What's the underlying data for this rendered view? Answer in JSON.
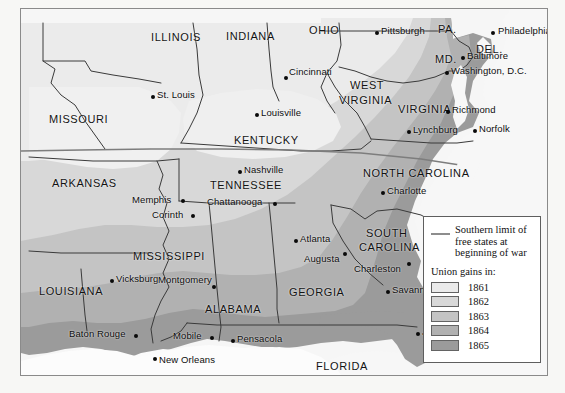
{
  "map": {
    "title": "Union gains during the Civil War",
    "states": [
      {
        "name": "MISSOURI",
        "x": 28,
        "y": 104,
        "size": "lg"
      },
      {
        "name": "ILLINOIS",
        "x": 130,
        "y": 22,
        "size": "lg"
      },
      {
        "name": "INDIANA",
        "x": 205,
        "y": 21,
        "size": "lg"
      },
      {
        "name": "OHIO",
        "x": 288,
        "y": 15,
        "size": "lg"
      },
      {
        "name": "PA.",
        "x": 417,
        "y": 14,
        "size": "lg"
      },
      {
        "name": "DEL.",
        "x": 455,
        "y": 34,
        "size": "lg"
      },
      {
        "name": "MD.",
        "x": 414,
        "y": 44,
        "size": "lg"
      },
      {
        "name": "WEST",
        "x": 329,
        "y": 70,
        "size": "lg"
      },
      {
        "name": "VIRGINIA",
        "x": 318,
        "y": 85,
        "size": "lg"
      },
      {
        "name": "VIRGINIA",
        "x": 377,
        "y": 94,
        "size": "lg"
      },
      {
        "name": "KENTUCKY",
        "x": 213,
        "y": 125,
        "size": "lg"
      },
      {
        "name": "ARKANSAS",
        "x": 31,
        "y": 168,
        "size": "lg"
      },
      {
        "name": "TENNESSEE",
        "x": 189,
        "y": 170,
        "size": "lg"
      },
      {
        "name": "NORTH CAROLINA",
        "x": 342,
        "y": 158,
        "size": "lg"
      },
      {
        "name": "SOUTH",
        "x": 345,
        "y": 218,
        "size": "lg"
      },
      {
        "name": "CAROLINA",
        "x": 338,
        "y": 232,
        "size": "lg"
      },
      {
        "name": "MISSISSIPPI",
        "x": 112,
        "y": 241,
        "size": "lg"
      },
      {
        "name": "LOUISIANA",
        "x": 18,
        "y": 276,
        "size": "lg"
      },
      {
        "name": "ALABAMA",
        "x": 184,
        "y": 294,
        "size": "lg"
      },
      {
        "name": "GEORGIA",
        "x": 268,
        "y": 277,
        "size": "lg"
      },
      {
        "name": "FLORIDA",
        "x": 295,
        "y": 351,
        "size": "lg"
      }
    ],
    "cities": [
      {
        "name": "Pittsburgh",
        "dx": 354,
        "dy": 22,
        "tx": 360,
        "ty": 16,
        "anchor": "left"
      },
      {
        "name": "Philadelphia",
        "dx": 470,
        "dy": 22,
        "tx": 477,
        "ty": 16,
        "anchor": "left"
      },
      {
        "name": "Baltimore",
        "dx": 440,
        "dy": 47,
        "tx": 446,
        "ty": 41,
        "anchor": "left"
      },
      {
        "name": "Washington, D.C.",
        "dx": 424,
        "dy": 62,
        "tx": 430,
        "ty": 56,
        "anchor": "left"
      },
      {
        "name": "Cincinnati",
        "dx": 263,
        "dy": 67,
        "tx": 268,
        "ty": 57,
        "anchor": "left"
      },
      {
        "name": "St. Louis",
        "dx": 130,
        "dy": 86,
        "tx": 136,
        "ty": 80,
        "anchor": "left"
      },
      {
        "name": "Louisville",
        "dx": 234,
        "dy": 104,
        "tx": 240,
        "ty": 98,
        "anchor": "left"
      },
      {
        "name": "Richmond",
        "dx": 425,
        "dy": 101,
        "tx": 431,
        "ty": 95,
        "anchor": "left"
      },
      {
        "name": "Lynchburg",
        "dx": 386,
        "dy": 121,
        "tx": 392,
        "ty": 115,
        "anchor": "left"
      },
      {
        "name": "Norfolk",
        "dx": 452,
        "dy": 120,
        "tx": 458,
        "ty": 114,
        "anchor": "left"
      },
      {
        "name": "Nashville",
        "dx": 217,
        "dy": 161,
        "tx": 223,
        "ty": 155,
        "anchor": "left"
      },
      {
        "name": "Charlotte",
        "dx": 360,
        "dy": 182,
        "tx": 366,
        "ty": 176,
        "anchor": "left"
      },
      {
        "name": "Memphis",
        "dx": 160,
        "dy": 190,
        "tx": 124,
        "ty": 185,
        "anchor": "right"
      },
      {
        "name": "Chattanooga",
        "dx": 252,
        "dy": 193,
        "tx": 200,
        "ty": 187,
        "anchor": "right"
      },
      {
        "name": "Corinth",
        "dx": 170,
        "dy": 205,
        "tx": 133,
        "ty": 200,
        "anchor": "right"
      },
      {
        "name": "Atlanta",
        "dx": 273,
        "dy": 230,
        "tx": 279,
        "ty": 224,
        "anchor": "left"
      },
      {
        "name": "Augusta",
        "dx": 322,
        "dy": 243,
        "tx": 283,
        "ty": 244,
        "anchor": "right"
      },
      {
        "name": "Charleston",
        "dx": 386,
        "dy": 253,
        "tx": 346,
        "ty": 254,
        "anchor": "right"
      },
      {
        "name": "Vicksburg",
        "dx": 89,
        "dy": 270,
        "tx": 95,
        "ty": 264,
        "anchor": "left"
      },
      {
        "name": "Montgomery",
        "dx": 191,
        "dy": 276,
        "tx": 158,
        "ty": 265,
        "anchor": "right"
      },
      {
        "name": "Savannah",
        "dx": 365,
        "dy": 281,
        "tx": 371,
        "ty": 275,
        "anchor": "left"
      },
      {
        "name": "Jacksonville",
        "dx": 395,
        "dy": 323,
        "tx": 401,
        "ty": 317,
        "anchor": "left"
      },
      {
        "name": "Baton Rouge",
        "dx": 113,
        "dy": 325,
        "tx": 58,
        "ty": 319,
        "anchor": "right"
      },
      {
        "name": "Mobile",
        "dx": 189,
        "dy": 327,
        "tx": 154,
        "ty": 321,
        "anchor": "right"
      },
      {
        "name": "Pensacola",
        "dx": 210,
        "dy": 330,
        "tx": 216,
        "ty": 324,
        "anchor": "left"
      },
      {
        "name": "New Orleans",
        "dx": 132,
        "dy": 348,
        "tx": 138,
        "ty": 349,
        "anchor": "left"
      }
    ]
  },
  "legend": {
    "limit_label": "Southern limit of free states at beginning of war",
    "limit_line_1": "Southern limit of",
    "limit_line_2": "free states at",
    "limit_line_3": "beginning of war",
    "limit_color": "#8d8d8d",
    "gains_title": "Union gains in:",
    "gains": [
      {
        "year": "1861",
        "color": "#ebebeb"
      },
      {
        "year": "1862",
        "color": "#d8d8d8"
      },
      {
        "year": "1863",
        "color": "#c4c4c4"
      },
      {
        "year": "1864",
        "color": "#b1b1b1"
      },
      {
        "year": "1865",
        "color": "#9b9b9b"
      }
    ]
  },
  "colors": {
    "union_free_state": "#b8b8b8",
    "water": "#f4f4f4",
    "border_line": "#3a3a3a",
    "frame": "#f7f7f5"
  }
}
